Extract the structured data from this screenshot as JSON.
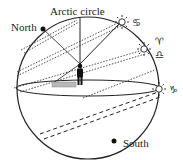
{
  "diagram": {
    "type": "celestial-sphere",
    "labels": {
      "north": "North",
      "south": "South",
      "arctic_circle": "Arctic circle"
    },
    "zodiac": {
      "cancer": "♋",
      "aries": "♈",
      "libra": "♎",
      "capricorn": "♑"
    },
    "sun_positions": [
      {
        "name": "summer-solstice",
        "sign": "cancer"
      },
      {
        "name": "equinox",
        "sign": "aries/libra"
      },
      {
        "name": "winter-solstice",
        "sign": "capricorn"
      }
    ],
    "colors": {
      "stroke": "#222222",
      "shadow": "#b8b8b8",
      "figure": "#111111"
    }
  }
}
